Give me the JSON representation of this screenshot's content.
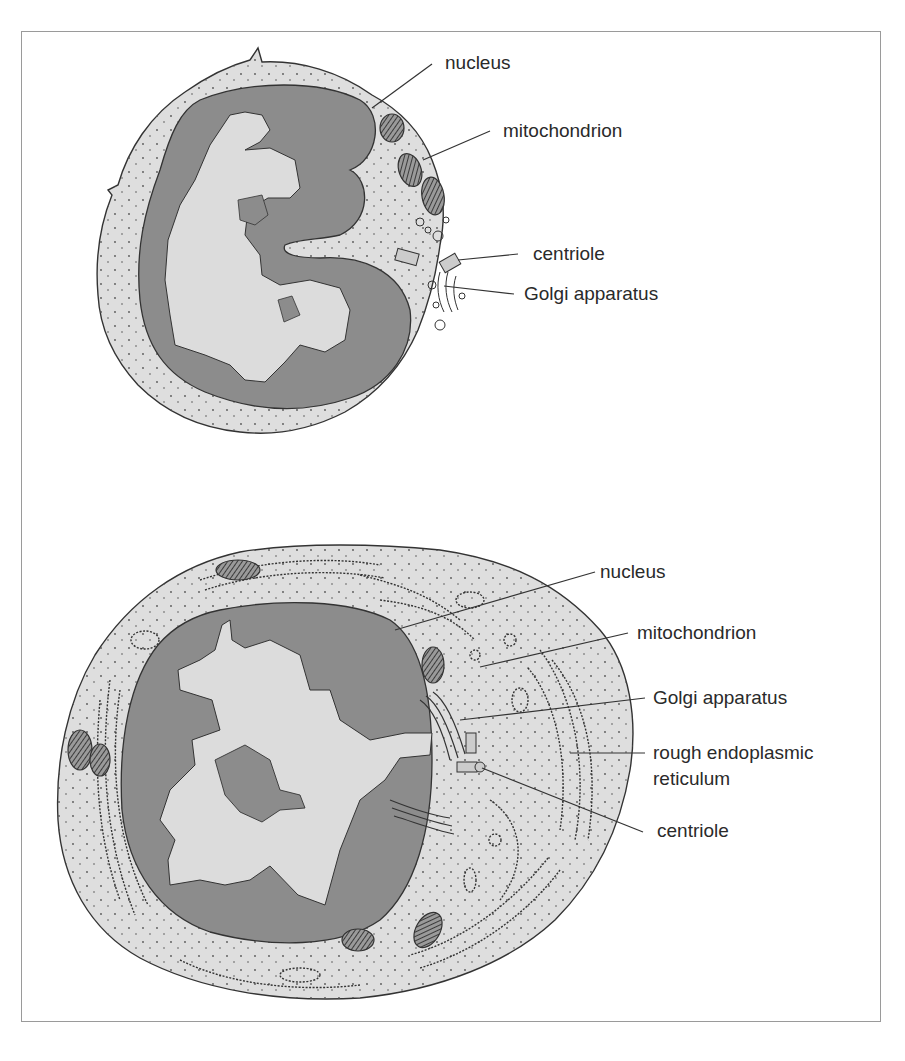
{
  "figure": {
    "colors": {
      "cytoplasm": "#dedede",
      "nucleus_heterochromatin": "#8c8c8c",
      "nucleus_euchromatin": "#dcdcdc",
      "outline": "#333333",
      "frame": "#9a9a9a",
      "text": "#2a2a2a"
    },
    "top_cell": {
      "labels": {
        "nucleus": "nucleus",
        "mitochondrion": "mitochondrion",
        "centriole": "centriole",
        "golgi": "Golgi apparatus"
      }
    },
    "bottom_cell": {
      "labels": {
        "nucleus": "nucleus",
        "mitochondrion": "mitochondrion",
        "golgi": "Golgi apparatus",
        "rer_line1": "rough endoplasmic",
        "rer_line2": "reticulum",
        "centriole": "centriole"
      }
    }
  }
}
